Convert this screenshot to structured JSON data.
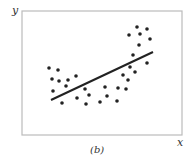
{
  "chart_data": {
    "type": "scatter",
    "title": "",
    "caption": "(b)",
    "xlabel": "x",
    "ylabel": "y",
    "grid": false,
    "legend": null,
    "frame": {
      "x0": 22,
      "y0": 11,
      "x1": 182,
      "y1": 135
    },
    "points_px": [
      [
        49,
        68
      ],
      [
        58,
        70
      ],
      [
        52,
        79
      ],
      [
        59,
        81
      ],
      [
        68,
        80
      ],
      [
        76,
        76
      ],
      [
        66,
        86
      ],
      [
        53,
        91
      ],
      [
        62,
        103
      ],
      [
        77,
        98
      ],
      [
        85,
        89
      ],
      [
        89,
        95
      ],
      [
        86,
        104
      ],
      [
        100,
        102
      ],
      [
        105,
        87
      ],
      [
        107,
        96
      ],
      [
        117,
        101
      ],
      [
        118,
        88
      ],
      [
        123,
        75
      ],
      [
        128,
        80
      ],
      [
        126,
        89
      ],
      [
        130,
        67
      ],
      [
        135,
        72
      ],
      [
        133,
        55
      ],
      [
        139,
        45
      ],
      [
        129,
        35
      ],
      [
        137,
        27
      ],
      [
        140,
        34
      ],
      [
        147,
        29
      ],
      [
        150,
        39
      ],
      [
        147,
        63
      ]
    ],
    "fit_line_px": {
      "x1": 51,
      "y1": 100,
      "x2": 153,
      "y2": 52
    },
    "colors": {
      "frame": "#bbbbbb",
      "points": "#222222",
      "line": "#222222"
    }
  }
}
